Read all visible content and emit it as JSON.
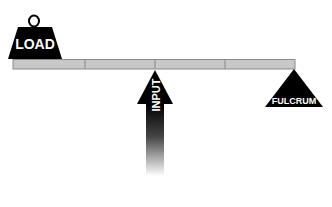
{
  "diagram": {
    "type": "lever",
    "labels": {
      "load": "LOAD",
      "input": "INPUT",
      "fulcrum": "FULCRUM"
    },
    "colors": {
      "beam_fill": "#c8c8c8",
      "beam_stroke": "#8a8a8a",
      "shapes": "#000000",
      "text": "#ffffff",
      "background": "#ffffff"
    }
  }
}
